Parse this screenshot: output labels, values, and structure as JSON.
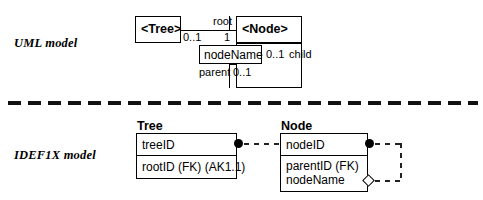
{
  "figure": {
    "sections": [
      {
        "label": "UML model"
      },
      {
        "label": "IDEF1X model"
      }
    ]
  },
  "uml": {
    "classes": [
      {
        "name": "<Tree>",
        "attributes": []
      },
      {
        "name": "<Node>",
        "attributes": [
          "nodeName"
        ]
      }
    ],
    "association_root": {
      "role_name": "root",
      "source_multiplicity": "0..1",
      "target_multiplicity": "1"
    },
    "association_child": {
      "child_role": "child",
      "child_multiplicity": "0..1",
      "parent_role": "parent",
      "parent_multiplicity": "0..1"
    }
  },
  "idef1x": {
    "entities": [
      {
        "name": "Tree",
        "key_attributes": [
          "treeID"
        ],
        "nonkey_attributes": [
          "rootID (FK) (AK1.1)"
        ]
      },
      {
        "name": "Node",
        "key_attributes": [
          "nodeID"
        ],
        "nonkey_attributes": [
          "parentID (FK)",
          "nodeName"
        ]
      }
    ],
    "relationships": [
      {
        "from": "Tree",
        "to": "Node",
        "style": "non-identifying-dashed",
        "parent_marker": "filled-dot"
      },
      {
        "from": "Node",
        "to": "Node",
        "style": "non-identifying-dashed",
        "parent_marker": "filled-dot",
        "child_marker": "diamond"
      }
    ]
  },
  "colors": {
    "ink": "#000000",
    "paper": "#ffffff"
  }
}
